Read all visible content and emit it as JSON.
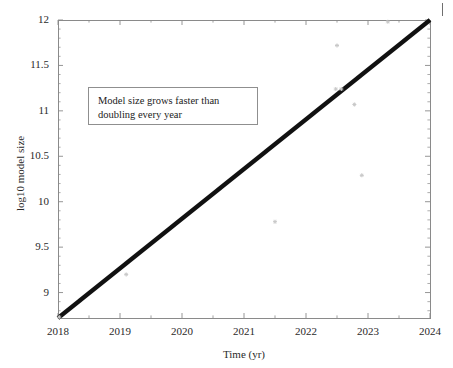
{
  "figure": {
    "width": 453,
    "height": 368,
    "background": "#ffffff"
  },
  "axes": {
    "frame_color": "#8a8a8a",
    "plot_left_px": 58,
    "plot_right_px": 430,
    "plot_top_px": 20,
    "plot_bottom_px": 318
  },
  "annotation": {
    "line1": "Model size grows faster than",
    "line2": "doubling every year",
    "border_color": "#8f8f8f"
  },
  "corner_mark": {
    "label": "top-right-tick-artifact"
  },
  "chart_data": {
    "type": "scatter",
    "title": "",
    "subtitle": "",
    "xlabel": "Time (yr)",
    "ylabel": "log10 model size",
    "xlim": [
      2018,
      2024
    ],
    "ylim": [
      8.72,
      12
    ],
    "xticks": [
      2018,
      2019,
      2020,
      2021,
      2022,
      2023,
      2024
    ],
    "xticklabels": [
      "2018",
      "2019",
      "2020",
      "2021",
      "2022",
      "2023",
      "2024"
    ],
    "yticks": [
      9,
      9.5,
      10,
      10.5,
      11,
      11.5,
      12
    ],
    "yticklabels": [
      "9",
      "9.5",
      "10",
      "10.5",
      "11",
      "11.5",
      "12"
    ],
    "xminor_step": 0.5,
    "yminor_step": 0.1,
    "grid": false,
    "legend": null,
    "tick_direction": "in",
    "box": true,
    "series": [
      {
        "name": "trend line",
        "type": "line",
        "color": "#111111",
        "linewidth": 4.2,
        "x": [
          2018,
          2024
        ],
        "y": [
          8.72,
          12.0
        ],
        "slope_per_year": 0.547,
        "note": "faster than doubling every year"
      },
      {
        "name": "model size observations",
        "type": "scatter",
        "color": "#c8c8c8",
        "marker": "star",
        "markersize": 4,
        "points": [
          {
            "x": 2018.02,
            "y": 8.73
          },
          {
            "x": 2019.1,
            "y": 9.2
          },
          {
            "x": 2021.5,
            "y": 9.78
          },
          {
            "x": 2022.48,
            "y": 11.24
          },
          {
            "x": 2022.57,
            "y": 11.24
          },
          {
            "x": 2022.5,
            "y": 11.72
          },
          {
            "x": 2022.78,
            "y": 11.07
          },
          {
            "x": 2022.9,
            "y": 10.29
          },
          {
            "x": 2023.32,
            "y": 11.98
          }
        ]
      }
    ],
    "annotations": [
      {
        "text": "Model size grows faster than doubling every year",
        "x_px": 88,
        "y_px": 87,
        "boxed": true
      }
    ]
  }
}
